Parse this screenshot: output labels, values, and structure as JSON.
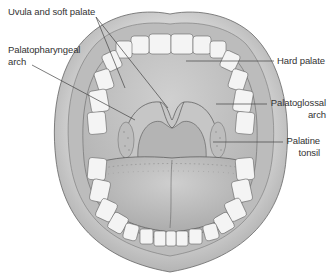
{
  "diagram": {
    "colors": {
      "lip": "#c9c9c9",
      "lip_shadow": "#a8a8a8",
      "inner": "#b9b9b9",
      "palate": "#c4c4c4",
      "tongue": "#bdbdbd",
      "teeth": "#f4f4f4",
      "outline": "#555555",
      "leader": "#444444",
      "text": "#333333"
    },
    "labels": {
      "uvula_soft_palate": "Uvula and soft palate",
      "palatopharyngeal_line1": "Palatopharyngeal",
      "palatopharyngeal_line2": "arch",
      "hard_palate": "Hard palate",
      "palatoglossal_line1": "Palatoglossal",
      "palatoglossal_line2": "arch",
      "palatine_line1": "Palatine",
      "palatine_line2": "tonsil"
    }
  }
}
